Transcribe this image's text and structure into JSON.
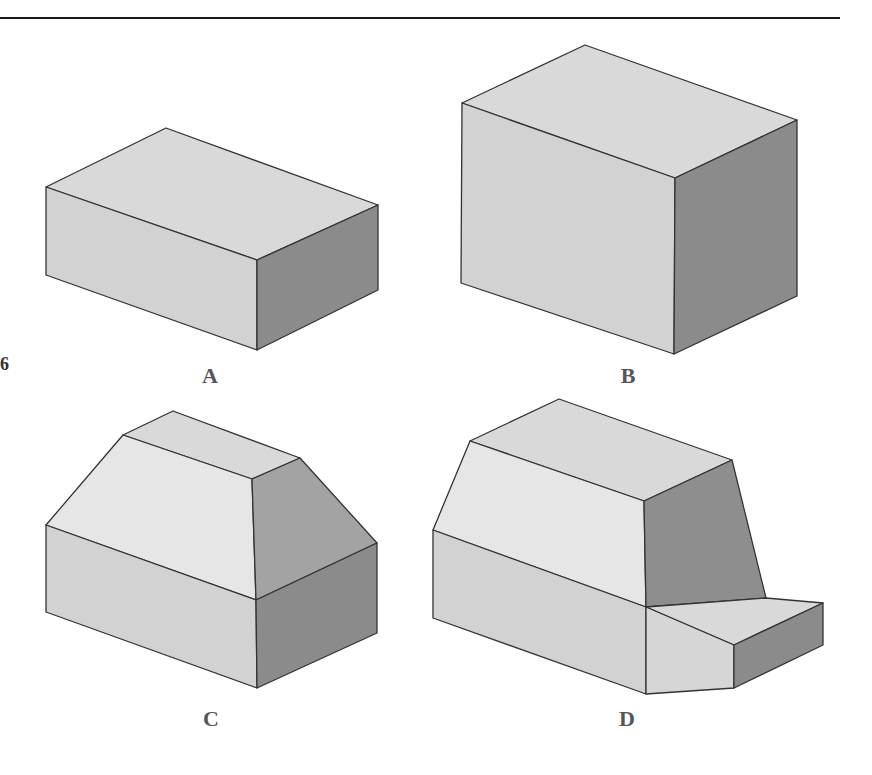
{
  "page": {
    "margin_number": "6",
    "bleed_through_text": [
      "ORGO ... of vertex messages ... Rather ... Kathy ... been rated by the",
      "that ... that ... to ... the ...",
      "... shows ..."
    ]
  },
  "figure": {
    "colors": {
      "top_face": "#d8d8d8",
      "front_face": "#d0d0d0",
      "slope_face": "#e4e4e4",
      "right_face": "#8a8a8a",
      "right_slope_face": "#a2a2a2",
      "edge": "#333333"
    },
    "shapes": [
      {
        "id": "A",
        "label": "A",
        "kind": "rectangular block (wide, short)"
      },
      {
        "id": "B",
        "label": "B",
        "kind": "rectangular block (tall)"
      },
      {
        "id": "C",
        "label": "C",
        "kind": "block with chamfered roof"
      },
      {
        "id": "D",
        "label": "D",
        "kind": "block with chamfered roof and front step"
      }
    ]
  }
}
